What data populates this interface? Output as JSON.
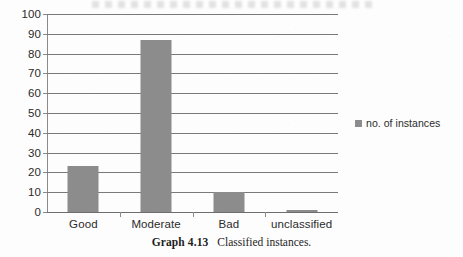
{
  "chart_data": {
    "type": "bar",
    "title": "",
    "xlabel": "",
    "ylabel": "",
    "categories": [
      "Good",
      "Moderate",
      "Bad",
      "unclassified"
    ],
    "series": [
      {
        "name": "no. of instances",
        "values": [
          23,
          87,
          10,
          1
        ],
        "color": "#8c8c8c"
      }
    ],
    "ylim": [
      0,
      100
    ],
    "y_ticks": [
      0,
      10,
      20,
      30,
      40,
      50,
      60,
      70,
      80,
      90,
      100
    ],
    "y_tick_labels": [
      "0",
      "10",
      "20",
      "30",
      "40",
      "50",
      "60",
      "70",
      "80",
      "90",
      "100"
    ],
    "grid": "horizontal",
    "legend_position": "right",
    "legend_entries": [
      "no. of instances"
    ]
  },
  "legend": {
    "label": "no. of instances",
    "swatch_color": "#8c8c8c",
    "swatch_name": "legend-color-swatch"
  },
  "caption": {
    "number": "Graph 4.13",
    "text": "Classified instances."
  },
  "colors": {
    "bar": "#8c8c8c",
    "gridline": "#7a7a7a",
    "axis": "#8a8a8a",
    "text": "#2b2b2b",
    "background": "#fdfdfd"
  }
}
